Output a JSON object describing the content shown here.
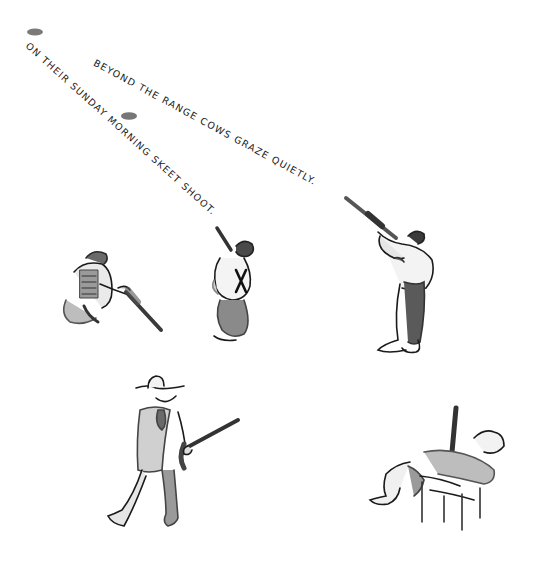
{
  "illustration": {
    "captions": [
      {
        "id": "caption-left",
        "text": "On their Sunday morning skeet shoot."
      },
      {
        "id": "caption-right",
        "text": "Beyond the range cows graze quietly."
      }
    ],
    "elements": [
      {
        "name": "clay-pigeon",
        "count": 2
      },
      {
        "name": "crouching-shooter-with-vest"
      },
      {
        "name": "standing-figure-with-suspenders"
      },
      {
        "name": "shooter-aiming-shotgun"
      },
      {
        "name": "man-in-cowboy-hat-carrying-shotgun"
      },
      {
        "name": "man-reclining-in-lawn-chair"
      }
    ],
    "colors": {
      "ink": "#1a1a1a",
      "wash_light": "#c8c8c8",
      "wash_mid": "#9a9a9a",
      "wash_dark": "#5a5a5a",
      "background": "#ffffff"
    }
  }
}
